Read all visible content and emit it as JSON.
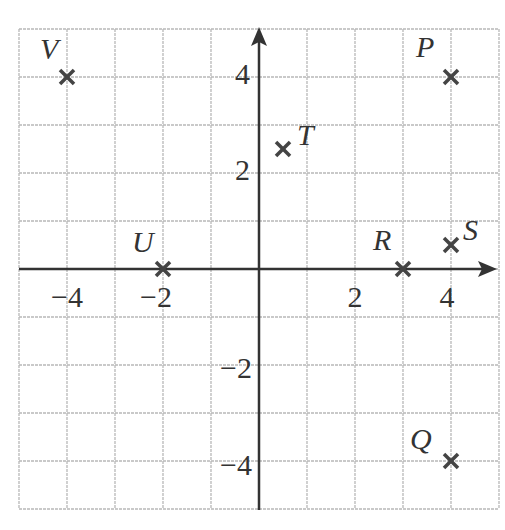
{
  "chart_data": {
    "type": "scatter",
    "title": "",
    "xlabel": "",
    "ylabel": "",
    "xlim": [
      -5,
      5
    ],
    "ylim": [
      -5,
      5
    ],
    "grid": true,
    "grid_step": 1,
    "x_tick_labels": [
      "-4",
      "-2",
      "2",
      "4"
    ],
    "y_tick_labels": [
      "4",
      "2",
      "-2",
      "-4"
    ],
    "marker": "x",
    "points": [
      {
        "label": "P",
        "x": 4,
        "y": 4
      },
      {
        "label": "Q",
        "x": 4,
        "y": -4
      },
      {
        "label": "R",
        "x": 3,
        "y": 0
      },
      {
        "label": "S",
        "x": 4,
        "y": 0.5
      },
      {
        "label": "T",
        "x": 0.5,
        "y": 2.5
      },
      {
        "label": "U",
        "x": -2,
        "y": 0
      },
      {
        "label": "V",
        "x": -4,
        "y": 4
      }
    ]
  },
  "colors": {
    "grid": "#b8b8b8",
    "axis": "#333333",
    "marker": "#444444",
    "text": "#333333"
  },
  "labels": {
    "x_ticks": {
      "m4": "−4",
      "m2": "−2",
      "p2": "2",
      "p4": "4"
    },
    "y_ticks": {
      "p4": "4",
      "p2": "2",
      "m2": "−2",
      "m4": "−4"
    },
    "points": {
      "P": "P",
      "Q": "Q",
      "R": "R",
      "S": "S",
      "T": "T",
      "U": "U",
      "V": "V"
    }
  }
}
